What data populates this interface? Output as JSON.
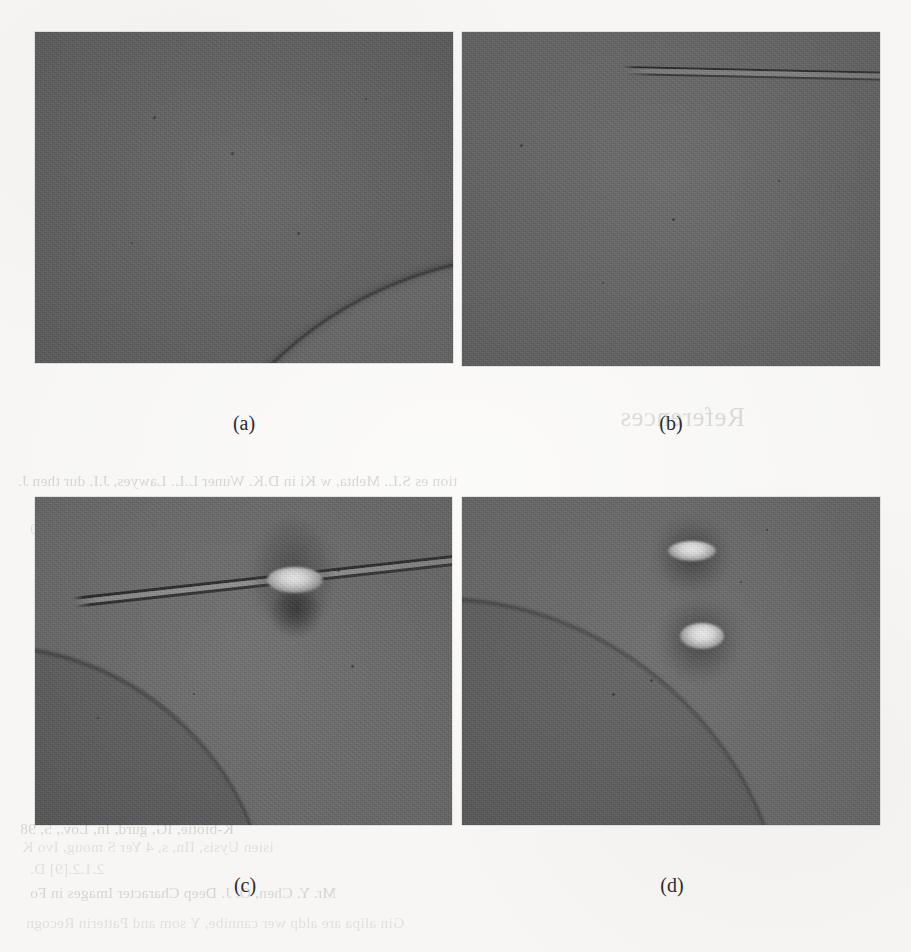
{
  "page": {
    "background_color": "#f7f6f4",
    "kind": "scanned-journal-page-figure"
  },
  "figure": {
    "layout": "2x2-grid",
    "panels": [
      {
        "id": "a",
        "caption": "(a)",
        "subject": "grayscale shadowgraph photograph",
        "description": "dark uniform field with a curved dark arc crossing the lower-right corner (edge of a sphere)",
        "base_gray": "#606060",
        "arc_color": "#2d2d2d"
      },
      {
        "id": "b",
        "caption": "(b)",
        "subject": "grayscale shadowgraph photograph",
        "description": "dark uniform field with a thin horizontal needle entering from upper area and running to the right edge",
        "base_gray": "#656565",
        "needle_color": "#1e1e1e"
      },
      {
        "id": "c",
        "caption": "(c)",
        "subject": "grayscale shadowgraph photograph",
        "description": "tilted needle across the frame carrying a bright pendant droplet at its centre, sphere edge arc in the lower-left corner",
        "base_gray": "#6c6c6c",
        "needle_color": "#202020",
        "droplet_highlight": "#f2f2f2"
      },
      {
        "id": "d",
        "caption": "(d)",
        "subject": "grayscale shadowgraph photograph",
        "description": "two detached bright droplets stacked vertically right of centre, sphere edge arc in the lower-left corner",
        "base_gray": "#6b6b6b",
        "droplet_highlight": "#f4f4f4",
        "droplet_count": 2
      }
    ]
  },
  "bleed_through": {
    "note": "faint mirrored text printed on the reverse of the sheet, showing through the paper",
    "color": "#8c8880",
    "lines": [
      {
        "text": "References",
        "size": "big"
      },
      {
        "text": "tion es S.L. Mehta, w Ki in D.K. Wuner L.L. Lawyes, J.I. dur then J."
      },
      {
        "text": "0"
      },
      {
        "text": "K-biotie, IG, gurd, In, Lov., 5, 98"
      },
      {
        "text": "Mr. Y. Chen, O. J. Deep Character Images in Fo"
      },
      {
        "text": "Gin alipa are aldp wer cannibe, Y som and Patterin Recogn"
      },
      {
        "text": "isien Uysis, IIn, s, 4 Yer S moug, Ivo K"
      },
      {
        "text": "2.1.2.[9] D."
      }
    ]
  }
}
